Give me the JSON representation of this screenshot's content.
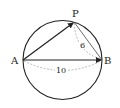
{
  "diagram": {
    "points": {
      "A": {
        "label": "A",
        "x": 23,
        "y": 60
      },
      "B": {
        "label": "B",
        "x": 102,
        "y": 60
      },
      "P": {
        "label": "P",
        "x": 74,
        "y": 22
      }
    },
    "circle": {
      "cx": 62.5,
      "cy": 60,
      "r": 39.5
    },
    "measurements": {
      "PB": "6",
      "AB": "10"
    },
    "colors": {
      "stroke": "#222222",
      "dashed": "#999999",
      "background": "#ffffff"
    }
  }
}
